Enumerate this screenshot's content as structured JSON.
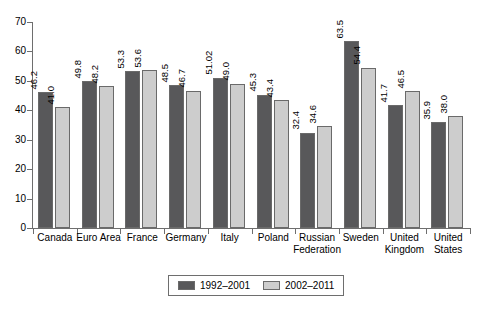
{
  "chart_data": {
    "type": "bar",
    "title": "",
    "subtitle": "",
    "xlabel": "",
    "ylabel": "",
    "ylim": [
      0,
      70
    ],
    "yticks": [
      0,
      10,
      20,
      30,
      40,
      50,
      60,
      70
    ],
    "grid": false,
    "legend_position": "bottom-center",
    "categories": [
      "Canada",
      "Euro Area",
      "France",
      "Germany",
      "Italy",
      "Poland",
      "Russian Federation",
      "Sweden",
      "United Kingdom",
      "United States"
    ],
    "series": [
      {
        "name": "1992–2001",
        "color": "#58585a",
        "values": [
          46.2,
          49.8,
          53.3,
          48.5,
          51.02,
          45.3,
          32.4,
          63.5,
          41.7,
          35.9
        ],
        "labels": [
          "46.2",
          "49.8",
          "53.3",
          "48.5",
          "51.02",
          "45.3",
          "32.4",
          "63.5",
          "41.7",
          "35.9"
        ]
      },
      {
        "name": "2002–2011",
        "color": "#cdcdcd",
        "values": [
          41.0,
          48.2,
          53.6,
          46.7,
          49.0,
          43.4,
          34.6,
          54.4,
          46.5,
          38.0
        ],
        "labels": [
          "41.0",
          "48.2",
          "53.6",
          "46.7",
          "49.0",
          "43.4",
          "34.6",
          "54.4",
          "46.5",
          "38.0"
        ]
      }
    ]
  },
  "legend": {
    "items": [
      {
        "label": "1992–2001",
        "color": "#58585a"
      },
      {
        "label": "2002–2011",
        "color": "#cdcdcd"
      }
    ]
  },
  "axis": {
    "y_tick_labels": [
      "0",
      "10",
      "20",
      "30",
      "40",
      "50",
      "60",
      "70"
    ]
  }
}
